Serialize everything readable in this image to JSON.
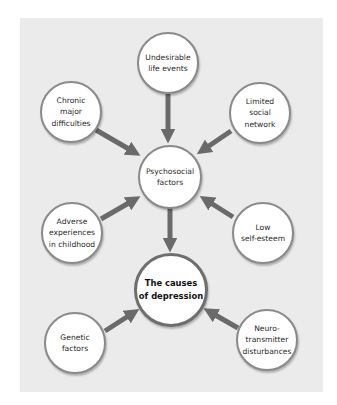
{
  "diagram": {
    "title": "The causes of depression",
    "colors": {
      "panel": "#ebebeb",
      "arrow": "#6a6a6a",
      "circle_border": "#8a8a8a",
      "circle_fill": "#ffffff"
    },
    "nodes": {
      "undesirable": {
        "label": "Undesirable\nlife events"
      },
      "chronic": {
        "label": "Chronic\nmajor\ndifficulties"
      },
      "limited": {
        "label": "Limited\nsocial\nnetwork"
      },
      "psychosocial": {
        "label": "Psychosocial\nfactors"
      },
      "adverse": {
        "label": "Adverse\nexperiences\nin childhood"
      },
      "low": {
        "label": "Low\nself-esteem"
      },
      "causes": {
        "label": "The causes\nof depression"
      },
      "genetic": {
        "label": "Genetic\nfactors"
      },
      "neuro": {
        "label": "Neuro-\ntransmitter\ndisturbances"
      }
    },
    "edges": [
      {
        "from": "Undesirable life events",
        "to": "Psychosocial factors"
      },
      {
        "from": "Chronic major difficulties",
        "to": "Psychosocial factors"
      },
      {
        "from": "Limited social network",
        "to": "Psychosocial factors"
      },
      {
        "from": "Adverse experiences in childhood",
        "to": "Psychosocial factors"
      },
      {
        "from": "Low self-esteem",
        "to": "Psychosocial factors"
      },
      {
        "from": "Psychosocial factors",
        "to": "The causes of depression"
      },
      {
        "from": "Genetic factors",
        "to": "The causes of depression"
      },
      {
        "from": "Neuro-transmitter disturbances",
        "to": "The causes of depression"
      }
    ]
  }
}
